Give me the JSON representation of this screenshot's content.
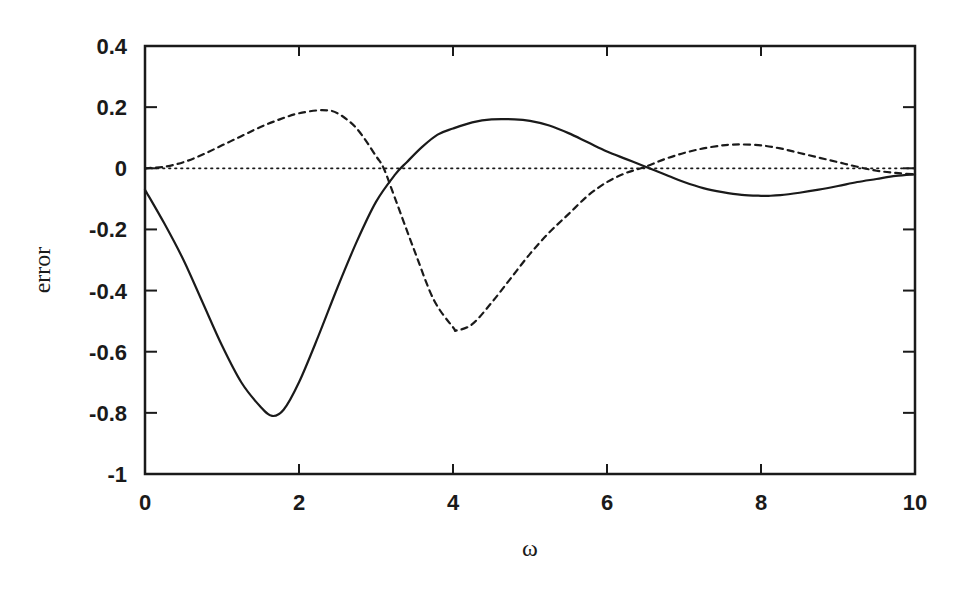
{
  "chart_data": {
    "type": "line",
    "title": "",
    "xlabel": "ω",
    "ylabel": "error",
    "xlim": [
      0,
      10
    ],
    "ylim": [
      -1,
      0.4
    ],
    "grid": false,
    "legend": null,
    "x_ticks": [
      0,
      2,
      4,
      6,
      8,
      10
    ],
    "x_tick_labels": [
      "0",
      "2",
      "4",
      "6",
      "8",
      "10"
    ],
    "y_ticks": [
      0.4,
      0.2,
      0,
      -0.2,
      -0.4,
      -0.6,
      -0.8,
      -1
    ],
    "y_tick_labels": [
      "0.4",
      "0.2",
      "0",
      "-0.2",
      "-0.4",
      "-0.6",
      "-0.8",
      "-1"
    ],
    "series": [
      {
        "name": "solid",
        "style": "solid",
        "x": [
          0,
          0.25,
          0.5,
          0.75,
          1.0,
          1.25,
          1.5,
          1.65,
          1.8,
          2.0,
          2.25,
          2.5,
          2.75,
          3.0,
          3.25,
          3.4,
          3.6,
          3.8,
          4.0,
          4.25,
          4.5,
          4.8,
          5.0,
          5.25,
          5.5,
          5.75,
          6.0,
          6.25,
          6.5,
          6.6,
          6.8,
          7.0,
          7.25,
          7.5,
          7.75,
          8.0,
          8.1,
          8.25,
          8.5,
          8.75,
          9.0,
          9.25,
          9.5,
          9.75,
          10.0
        ],
        "y": [
          -0.07,
          -0.18,
          -0.3,
          -0.44,
          -0.58,
          -0.7,
          -0.78,
          -0.81,
          -0.79,
          -0.7,
          -0.55,
          -0.39,
          -0.24,
          -0.11,
          -0.02,
          0.02,
          0.07,
          0.11,
          0.13,
          0.15,
          0.16,
          0.16,
          0.155,
          0.14,
          0.115,
          0.085,
          0.055,
          0.03,
          0.005,
          -0.005,
          -0.025,
          -0.045,
          -0.065,
          -0.078,
          -0.087,
          -0.09,
          -0.09,
          -0.088,
          -0.08,
          -0.07,
          -0.058,
          -0.045,
          -0.035,
          -0.025,
          -0.02
        ]
      },
      {
        "name": "dashed",
        "style": "dashed",
        "x": [
          0,
          0.25,
          0.5,
          0.75,
          1.0,
          1.25,
          1.5,
          1.75,
          2.0,
          2.3,
          2.5,
          2.75,
          3.0,
          3.1,
          3.25,
          3.5,
          3.75,
          4.0,
          4.05,
          4.25,
          4.5,
          4.75,
          5.0,
          5.25,
          5.5,
          5.75,
          6.0,
          6.25,
          6.5,
          6.75,
          7.0,
          7.25,
          7.5,
          7.6,
          7.75,
          8.0,
          8.25,
          8.5,
          8.75,
          9.0,
          9.25,
          9.5,
          9.75,
          10.0
        ],
        "y": [
          0.0,
          0.005,
          0.02,
          0.045,
          0.075,
          0.105,
          0.135,
          0.16,
          0.18,
          0.19,
          0.18,
          0.13,
          0.04,
          0.0,
          -0.1,
          -0.27,
          -0.43,
          -0.52,
          -0.53,
          -0.51,
          -0.44,
          -0.36,
          -0.28,
          -0.21,
          -0.15,
          -0.09,
          -0.045,
          -0.015,
          0.005,
          0.03,
          0.05,
          0.065,
          0.075,
          0.077,
          0.078,
          0.075,
          0.065,
          0.05,
          0.035,
          0.02,
          0.005,
          -0.008,
          -0.015,
          -0.02
        ]
      },
      {
        "name": "dotted",
        "style": "dotted",
        "x": [
          0,
          10
        ],
        "y": [
          0,
          0
        ]
      }
    ]
  }
}
